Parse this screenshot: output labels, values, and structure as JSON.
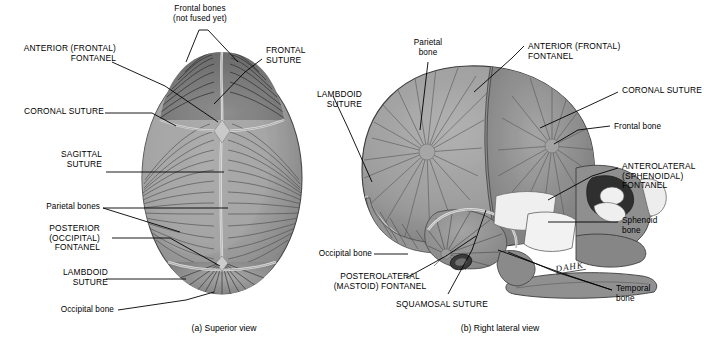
{
  "figure": {
    "captions": [
      {
        "key": "a",
        "text": "(a)  Superior view"
      },
      {
        "key": "b",
        "text": "(b)  Right lateral view"
      }
    ],
    "signature": "DAHK"
  },
  "colors": {
    "bone_light": "#b9b9b9",
    "bone_mid": "#9e9e9e",
    "bone_dark": "#838383",
    "bone_darker": "#6f6f6f",
    "suture_light": "#d8d8d8",
    "line": "#000000",
    "highlight": "#efefef",
    "background": "#ffffff"
  },
  "superior_view": {
    "labels": [
      {
        "id": "frontal-bones",
        "text": "Frontal bones\n(not fused yet)",
        "style": "sentence",
        "align": "center"
      },
      {
        "id": "anterior-frontal-fontanel",
        "text": "ANTERIOR (FRONTAL)\nFONTANEL",
        "style": "caps",
        "align": "right"
      },
      {
        "id": "frontal-suture",
        "text": "FRONTAL\nSUTURE",
        "style": "caps",
        "align": "left"
      },
      {
        "id": "coronal-suture",
        "text": "CORONAL SUTURE",
        "style": "caps",
        "align": "right"
      },
      {
        "id": "sagittal-suture",
        "text": "SAGITTAL\nSUTURE",
        "style": "caps",
        "align": "right"
      },
      {
        "id": "parietal-bones",
        "text": "Parietal bones",
        "style": "sentence",
        "align": "right"
      },
      {
        "id": "posterior-occipital-fontanel",
        "text": "POSTERIOR\n(OCCIPITAL)\nFONTANEL",
        "style": "caps",
        "align": "right"
      },
      {
        "id": "lambdoid-suture",
        "text": "LAMBDOID\nSUTURE",
        "style": "caps",
        "align": "right"
      },
      {
        "id": "occipital-bone",
        "text": "Occipital bone",
        "style": "sentence",
        "align": "right"
      }
    ]
  },
  "lateral_view": {
    "labels": [
      {
        "id": "parietal-bone",
        "text": "Parietal\nbone",
        "style": "sentence",
        "align": "center"
      },
      {
        "id": "anterior-frontal-fontanel",
        "text": "ANTERIOR (FRONTAL)\nFONTANEL",
        "style": "caps",
        "align": "left"
      },
      {
        "id": "lambdoid-suture",
        "text": "LAMBDOID\nSUTURE",
        "style": "caps",
        "align": "right"
      },
      {
        "id": "coronal-suture",
        "text": "CORONAL SUTURE",
        "style": "caps",
        "align": "left"
      },
      {
        "id": "frontal-bone",
        "text": "Frontal bone",
        "style": "sentence",
        "align": "left"
      },
      {
        "id": "anterolateral-sphenoidal-fontanel",
        "text": "ANTEROLATERAL\n(SPHENOIDAL)\nFONTANEL",
        "style": "caps",
        "align": "left"
      },
      {
        "id": "sphenoid-bone",
        "text": "Sphenoid\nbone",
        "style": "sentence",
        "align": "left"
      },
      {
        "id": "occipital-bone",
        "text": "Occipital bone",
        "style": "sentence",
        "align": "right"
      },
      {
        "id": "temporal-bone",
        "text": "Temporal\nbone",
        "style": "sentence",
        "align": "left"
      },
      {
        "id": "posterolateral-mastoid-fontanel",
        "text": "POSTEROLATERAL\n(MASTOID) FONTANEL",
        "style": "caps",
        "align": "center"
      },
      {
        "id": "squamosal-suture",
        "text": "SQUAMOSAL SUTURE",
        "style": "caps",
        "align": "center"
      }
    ]
  }
}
